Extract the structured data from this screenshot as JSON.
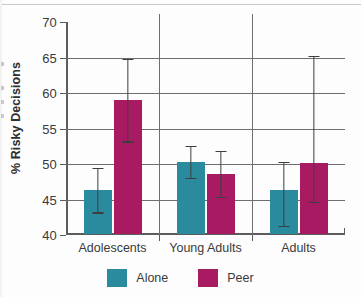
{
  "chart_data": {
    "type": "bar",
    "title": "",
    "subtitle": "",
    "xlabel": "",
    "ylabel": "% Risky Decisions",
    "categories": [
      "Adolescents",
      "Young Adults",
      "Adults"
    ],
    "ylim": [
      40,
      70
    ],
    "yticks": [
      40,
      45,
      50,
      55,
      60,
      65,
      70
    ],
    "ytick_labels": [
      "40",
      "45",
      "50",
      "55",
      "60",
      "65",
      "70"
    ],
    "grid": true,
    "grid_axis": "y",
    "legend_position": "bottom",
    "error_bar_type": "95% CI",
    "series": [
      {
        "name": "Alone",
        "color": "#2b8b9e",
        "values": [
          46.2,
          50.2,
          46.2
        ],
        "error_low": [
          43.0,
          47.9,
          41.1
        ],
        "error_high": [
          49.5,
          52.6,
          50.3
        ]
      },
      {
        "name": "Peer",
        "color": "#a81a62",
        "values": [
          58.9,
          48.5,
          50.0
        ],
        "error_low": [
          53.0,
          45.2,
          44.5
        ],
        "error_high": [
          64.8,
          51.9,
          65.2
        ]
      }
    ]
  },
  "legend": {
    "items": [
      {
        "label": "Alone",
        "color": "#2b8b9e"
      },
      {
        "label": "Peer",
        "color": "#a81a62"
      }
    ]
  },
  "axis": {
    "y_title": "% Risky Decisions"
  },
  "colors": {
    "alone": "#2b8b9e",
    "peer": "#a81a62",
    "axis": "#5c5c5c",
    "grid": "#6e6e6e",
    "error": "#3e3e3e",
    "text": "#3a3a3a",
    "background": "#fdfdfd"
  }
}
